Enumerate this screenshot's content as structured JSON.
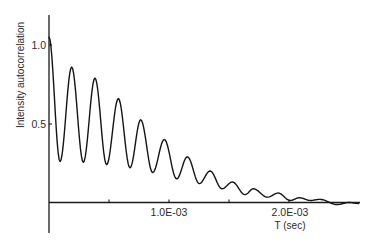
{
  "chart_data": {
    "type": "line",
    "title": "",
    "xlabel": "T (sec)",
    "ylabel": "Intensity autocorrelation",
    "xlim": [
      0,
      0.00258
    ],
    "ylim": [
      -0.2,
      1.18
    ],
    "grid": false,
    "legend": null,
    "x_ticks": [
      {
        "value": 0.0005,
        "label": ""
      },
      {
        "value": 0.001,
        "label": "1.0E-03"
      },
      {
        "value": 0.0015,
        "label": ""
      },
      {
        "value": 0.002,
        "label": "2.0E-03"
      }
    ],
    "y_ticks": [
      {
        "value": 0.5,
        "label": "0.5"
      },
      {
        "value": 1.0,
        "label": "1.0"
      }
    ],
    "series": [
      {
        "name": "Intensity autocorrelation",
        "x": [
          0,
          9.2e-05,
          0.000189,
          0.000286,
          0.000383,
          0.00048,
          0.000578,
          0.000675,
          0.000764,
          0.000864,
          0.000961,
          0.001064,
          0.001153,
          0.001253,
          0.001342,
          0.001442,
          0.001528,
          0.001633,
          0.001703,
          0.00182,
          0.00191,
          0.00201,
          0.002086,
          0.00218,
          0.002258,
          0.0024,
          0.0025,
          0.00258
        ],
        "y": [
          1.05,
          0.26,
          0.86,
          0.255,
          0.79,
          0.24,
          0.66,
          0.22,
          0.525,
          0.19,
          0.4,
          0.15,
          0.29,
          0.12,
          0.2,
          0.087,
          0.13,
          0.05,
          0.087,
          0.034,
          0.06,
          0.013,
          0.03,
          0.013,
          0.02,
          -0.013,
          0.0,
          -0.006
        ]
      }
    ]
  },
  "labels": {
    "ylabel": "Intensity autocorrelation",
    "xlabel": "T (sec)",
    "ytick_1_0": "1.0",
    "ytick_0_5": "0.5",
    "xtick_1e3": "1.0E-03",
    "xtick_2e3": "2.0E-03"
  }
}
